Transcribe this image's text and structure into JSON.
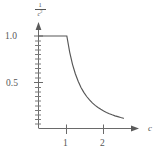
{
  "figure": {
    "name": "decay-plot",
    "background": "#ffffff",
    "line_color": "#565656",
    "axis_color": "#6a6a6a",
    "text_color": "#565656"
  },
  "axis_labels": {
    "y_numerator": "1",
    "y_denominator": "c",
    "y_exponent": "2",
    "x": "c"
  },
  "ticks": {
    "y": [
      {
        "value": "1.0"
      },
      {
        "value": "0.5"
      }
    ],
    "x": [
      {
        "value": "1"
      },
      {
        "value": "2"
      }
    ]
  },
  "chart_data": {
    "type": "line",
    "title": "",
    "xlabel": "c",
    "ylabel": "1/c^2",
    "xlim": [
      0,
      3.3
    ],
    "ylim": [
      0,
      1.12
    ],
    "grid": false,
    "legend": null,
    "xticks": [
      1,
      2
    ],
    "xticklabels": [
      "1",
      "2"
    ],
    "yticks": [
      0.5,
      1.0
    ],
    "yticklabels": [
      "0.5",
      "1.0"
    ],
    "y_minor_ticks": [
      0.05,
      0.1,
      0.15,
      0.2,
      0.25,
      0.3,
      0.35,
      0.4,
      0.45,
      0.55,
      0.6,
      0.65,
      0.7,
      0.75,
      0.8,
      0.85,
      0.9,
      0.95
    ],
    "axis_arrows": [
      "x-right",
      "y-up"
    ],
    "series": [
      {
        "name": "min(1, 1/c^2)",
        "x": [
          0.0,
          0.2,
          0.4,
          0.6,
          0.8,
          1.0,
          1.1,
          1.2,
          1.3,
          1.4,
          1.5,
          1.6,
          1.7,
          1.8,
          1.9,
          2.0,
          2.1,
          2.2,
          2.3,
          2.4,
          2.5,
          2.6,
          2.7,
          2.8,
          2.9,
          3.0
        ],
        "y": [
          1.0,
          1.0,
          1.0,
          1.0,
          1.0,
          1.0,
          0.826,
          0.694,
          0.592,
          0.51,
          0.444,
          0.391,
          0.346,
          0.309,
          0.277,
          0.25,
          0.227,
          0.207,
          0.189,
          0.174,
          0.16,
          0.148,
          0.137,
          0.128,
          0.119,
          0.111
        ]
      }
    ]
  }
}
